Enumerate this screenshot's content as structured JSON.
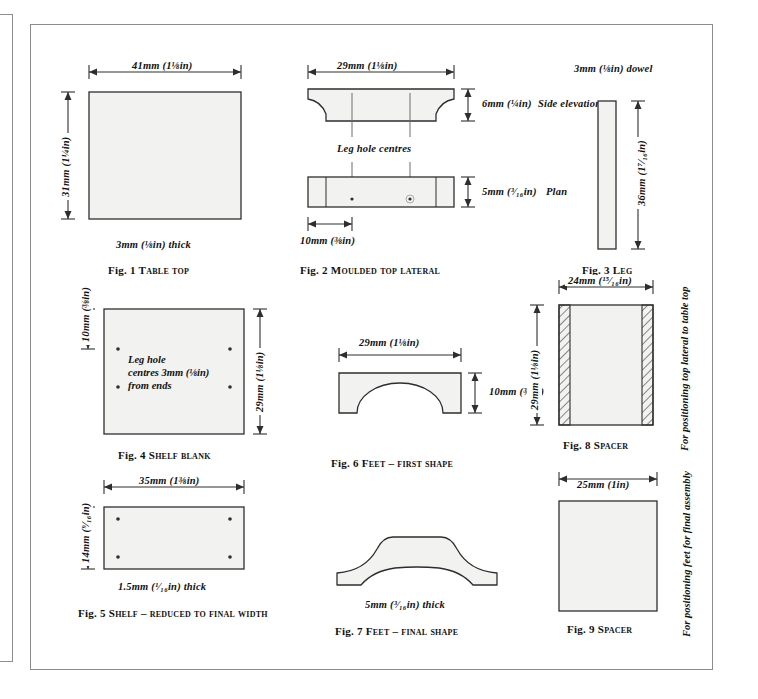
{
  "page": {
    "background": "#ffffff",
    "frame_color": "#8b8b8b",
    "line_color": "#3a3a3a",
    "fill_color": "#f2f2f0"
  },
  "figures": [
    {
      "id": "fig1",
      "caption_number": "Fig. 1",
      "caption_title": "Table top",
      "width_dim": "41mm (1⅛in)",
      "height_dim": "31mm (1¼in)",
      "thickness_note": "3mm (⅛in) thick"
    },
    {
      "id": "fig2",
      "caption_number": "Fig. 2",
      "caption_title": "Moulded top lateral",
      "width_dim": "29mm (1⅛in)",
      "elevation_dim": "6mm (¼in)",
      "elevation_label": "Side elevation",
      "plan_dim": "5mm (³⁄₁₆in)",
      "plan_label": "Plan",
      "leg_hole_note": "Leg hole centres",
      "end_dim": "10mm (⅜in)"
    },
    {
      "id": "fig3",
      "caption_number": "Fig. 3",
      "caption_title": "Leg",
      "dowel_note": "3mm (⅛in) dowel",
      "length_dim": "36mm (1⁷⁄₁₆in)"
    },
    {
      "id": "fig4",
      "caption_number": "Fig. 4",
      "caption_title": "Shelf blank",
      "left_dim": "10mm (⅜in)",
      "right_dim": "29mm (1⅛in)",
      "note_line1": "Leg hole",
      "note_line2": "centres 3mm (⅛in)",
      "note_line3": "from ends"
    },
    {
      "id": "fig5",
      "caption_number": "Fig. 5",
      "caption_title": "Shelf – reduced to final width",
      "width_dim": "35mm (1⅜in)",
      "height_dim": "14mm (⁹⁄₁₆in)",
      "thickness_note": "1.5mm (¹⁄₁₆in) thick"
    },
    {
      "id": "fig6",
      "caption_number": "Fig. 6",
      "caption_title": "Feet – first shape",
      "width_dim": "29mm (1⅛in)",
      "height_dim": "10mm (⅜in)"
    },
    {
      "id": "fig7",
      "caption_number": "Fig. 7",
      "caption_title": "Feet – final shape",
      "thickness_note": "5mm (³⁄₁₆in) thick"
    },
    {
      "id": "fig8",
      "caption_number": "Fig. 8",
      "caption_title": "Spacer",
      "width_dim": "24mm (¹⁵⁄₁₆in)",
      "height_dim": "29mm (1⅛in)",
      "side_note": "For positioning top lateral to table top"
    },
    {
      "id": "fig9",
      "caption_number": "Fig. 9",
      "caption_title": "Spacer",
      "width_dim": "25mm (1in)",
      "side_note": "For positioning feet for final assembly"
    }
  ]
}
